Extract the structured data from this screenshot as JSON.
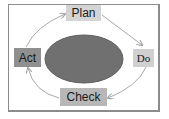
{
  "diagram": {
    "type": "cycle",
    "title": "",
    "steps": [
      {
        "id": "plan",
        "label": "Plan"
      },
      {
        "id": "do",
        "label": "Do"
      },
      {
        "id": "check",
        "label": "Check"
      },
      {
        "id": "act",
        "label": "Act"
      }
    ],
    "flow": [
      "Plan → Do",
      "Do → Check",
      "Check → Act",
      "Act → Plan"
    ],
    "center": {
      "shape": "ellipse",
      "label": ""
    },
    "colors": {
      "plan_box": "#d4d4d4",
      "do_box": "#d0d0d0",
      "check_box": "#b7b7b7",
      "act_box": "#8f8f8f",
      "center_ellipse": "#707070",
      "arrows": "#a8a8a8",
      "frame": "#8c8c8c"
    }
  }
}
